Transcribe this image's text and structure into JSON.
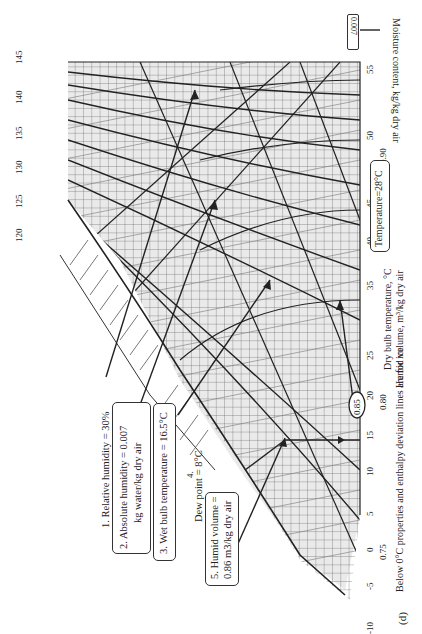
{
  "figure": {
    "panel_label": "(d)",
    "footnote": "Below 0°C properties and enthalpy deviation lines are for ice",
    "orientation": "rotated 90° counter-clockwise"
  },
  "axes": {
    "dry_bulb_label": "Dry bulb temperature, °C",
    "humid_volume_label": "Humid volume, m³/kg dry air",
    "moisture_label": "Moisture content, kg/kg dry air",
    "enthalpy_sat_label": "Enthalpy at saturation, kJ/kg dry air",
    "enthalpy_dev_label": "Enthalpy deviation kJ/kg dry air",
    "relative_humidity_label": "Relative humidity",
    "dry_bulb_ticks": [
      "-10",
      "-5",
      "0",
      "5",
      "10",
      "15",
      "20",
      "25",
      "30",
      "35",
      "40",
      "45",
      "50",
      "55"
    ],
    "humid_volume_ticks": [
      "0.75",
      "0.80",
      "0.85",
      "0.90"
    ],
    "moisture_ticks": [
      "0.033",
      "0.032",
      "0.031",
      "0.030",
      "0.029",
      "0.028",
      "0.027",
      "0.026",
      "0.025",
      "0.024",
      "0.023",
      "0.022",
      "0.021",
      "0.020",
      "0.019",
      "0.018",
      "0.017",
      "0.016",
      "0.015",
      "0.014",
      "0.013",
      "0.012",
      "0.011",
      "0.010",
      "0.009",
      "0.008",
      "0.007",
      "0.006",
      "0.005",
      "0.004",
      "0.003",
      "0.002",
      "0.001",
      "0.000"
    ],
    "enthalpy_top_ticks": [
      "120",
      "125",
      "130",
      "135",
      "140",
      "145"
    ],
    "enthalpy_diag_ticks": [
      "115",
      "110",
      "105",
      "100",
      "95",
      "90",
      "85",
      "80",
      "75",
      "70",
      "65",
      "60",
      "55",
      "50",
      "45",
      "40"
    ],
    "wet_bulb_ticks": [
      "-10",
      "-5",
      "0",
      "5",
      "10",
      "15",
      "20",
      "25",
      "30",
      "35",
      "40"
    ],
    "rh_labels": [
      "10%",
      "20%",
      "30%",
      "40%",
      "50%",
      "60%",
      "70%",
      "80%",
      "90%"
    ],
    "enthalpy_dev_labels": [
      "-0.2",
      "-0.4",
      "-0.6",
      "-0.8",
      "-1.0",
      "-1.2"
    ]
  },
  "annotations": {
    "rh": "1. Relative humidity = 30%",
    "abs_humidity_line1": "2. Absolute humidity = 0.007",
    "abs_humidity_line2": "kg water/kg dry air",
    "wet_bulb": "3. Wet bulb temperature = 16.5°C",
    "dew_point": "Dew point = 8°C",
    "dew_point_marker": "4.",
    "humid_volume_line1": "5. Humid volume =",
    "humid_volume_line2": "0.86 m3/kg dry air",
    "temperature": "Temperature=28°C",
    "humid_volume_value": "0.85",
    "moisture_highlight": "0.007"
  }
}
